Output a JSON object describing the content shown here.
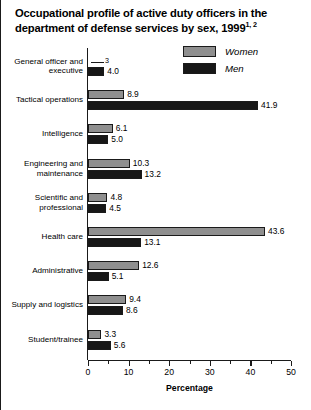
{
  "chart_data": {
    "type": "bar",
    "orientation": "horizontal",
    "title": "Occupational profile of active duty officers in the department of defense services by sex, 1999",
    "title_footnotes": "1, 2",
    "xlabel": "Percentage",
    "ylabel": "",
    "xlim": [
      0,
      50
    ],
    "xticks": [
      0,
      10,
      20,
      30,
      40,
      50
    ],
    "xtick_labels": [
      "0",
      "10",
      "20",
      "30",
      "40",
      "50"
    ],
    "minor_xticks": [
      5,
      15,
      25,
      35,
      45
    ],
    "grid": false,
    "legend_position": "top-right",
    "categories": [
      "General officer and executive",
      "Tactical operations",
      "Intelligence",
      "Engineering and maintenance",
      "Scientific and professional",
      "Health care",
      "Administrative",
      "Supply and logistics",
      "Student/trainee"
    ],
    "series": [
      {
        "name": "Women",
        "color": "#8f8f8f",
        "values": [
          null,
          8.9,
          6.1,
          10.3,
          4.8,
          43.6,
          12.6,
          9.4,
          3.3
        ],
        "labels": [
          "",
          "8.9",
          "6.1",
          "10.3",
          "4.8",
          "43.6",
          "12.6",
          "9.4",
          "3.3"
        ],
        "suppressed": [
          {
            "index": 0,
            "marker": "—",
            "footnote": "3"
          }
        ]
      },
      {
        "name": "Men",
        "color": "#171717",
        "values": [
          4.0,
          41.9,
          5.0,
          13.2,
          4.5,
          13.1,
          5.1,
          8.6,
          5.6
        ],
        "labels": [
          "4.0",
          "41.9",
          "5.0",
          "13.2",
          "4.5",
          "13.1",
          "5.1",
          "8.6",
          "5.6"
        ]
      }
    ]
  },
  "legend": {
    "items": [
      {
        "label": "Women",
        "swatch": "women"
      },
      {
        "label": "Men",
        "swatch": "men"
      }
    ]
  }
}
